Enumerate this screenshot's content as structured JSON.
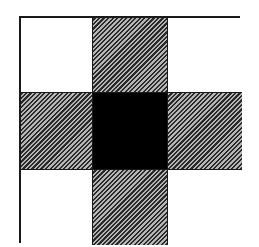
{
  "diagram": {
    "type": "3x3 grid",
    "colors": {
      "border": "#1a1a1a",
      "white": "#ffffff",
      "hatch_dark": "#2a2a2a",
      "hatch_light": "#b5b5b5",
      "center": "#000000"
    },
    "cells": [
      {
        "row": 0,
        "col": 0,
        "fill": "white"
      },
      {
        "row": 0,
        "col": 1,
        "fill": "hatched"
      },
      {
        "row": 0,
        "col": 2,
        "fill": "white"
      },
      {
        "row": 1,
        "col": 0,
        "fill": "hatched"
      },
      {
        "row": 1,
        "col": 1,
        "fill": "black"
      },
      {
        "row": 1,
        "col": 2,
        "fill": "hatched"
      },
      {
        "row": 2,
        "col": 0,
        "fill": "white"
      },
      {
        "row": 2,
        "col": 1,
        "fill": "hatched"
      },
      {
        "row": 2,
        "col": 2,
        "fill": "white"
      }
    ]
  }
}
